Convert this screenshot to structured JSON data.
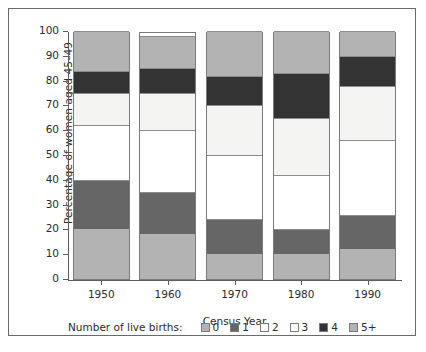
{
  "chart_data": {
    "type": "bar",
    "subtype": "stacked-bar-100",
    "title": "",
    "xlabel": "Census Year",
    "ylabel": "Percentage of women aged 45–49",
    "categories": [
      "1950",
      "1960",
      "1970",
      "1980",
      "1990"
    ],
    "ylim": [
      0,
      100
    ],
    "yticks": [
      0,
      10,
      20,
      30,
      40,
      50,
      60,
      70,
      80,
      90,
      100
    ],
    "ytick_labels": [
      "0",
      "10",
      "20",
      "30",
      "40",
      "50",
      "60",
      "70",
      "80",
      "90",
      "100"
    ],
    "grid": false,
    "legend_position": "bottom",
    "legend_title": "Number of live births:",
    "series": [
      {
        "name": "0",
        "color": "#b3b3b3",
        "values": [
          20,
          18,
          10,
          10,
          12
        ]
      },
      {
        "name": "1",
        "color": "#666666",
        "values": [
          20,
          17,
          14,
          10,
          14
        ]
      },
      {
        "name": "2",
        "color": "#ffffff",
        "values": [
          22,
          25,
          26,
          22,
          30
        ]
      },
      {
        "name": "3",
        "color": "#f4f4f2",
        "values": [
          13,
          15,
          20,
          23,
          22
        ]
      },
      {
        "name": "4",
        "color": "#333333",
        "values": [
          9,
          10,
          12,
          18,
          12
        ]
      },
      {
        "name": "5+",
        "color": "#b3b3b3",
        "values": [
          16,
          13,
          18,
          17,
          10
        ]
      }
    ],
    "cumulative_boundaries": {
      "1950": [
        0,
        20,
        40,
        62,
        75,
        84,
        100
      ],
      "1960": [
        0,
        18,
        35,
        60,
        75,
        85,
        98
      ],
      "1970": [
        0,
        10,
        24,
        50,
        70,
        82,
        100
      ],
      "1980": [
        0,
        10,
        20,
        42,
        65,
        83,
        100
      ],
      "1990": [
        0,
        12,
        26,
        56,
        78,
        90,
        100
      ]
    }
  },
  "axes": {
    "y_title": "Percentage of women aged 45–49",
    "x_title": "Census Year"
  },
  "legend": {
    "title": "Number of live births:",
    "items": [
      {
        "label": "0",
        "color": "#b3b3b3"
      },
      {
        "label": "1",
        "color": "#666666"
      },
      {
        "label": "2",
        "color": "#ffffff"
      },
      {
        "label": "3",
        "color": "#fbfbfa"
      },
      {
        "label": "4",
        "color": "#333333"
      },
      {
        "label": "5+",
        "color": "#b3b3b3"
      }
    ]
  },
  "colors": {
    "frame": "#6b6b6b",
    "axis": "#5d5d5d",
    "text": "#2b2b2b",
    "bar_outline": "#7a7a7a",
    "background": "#ffffff"
  }
}
